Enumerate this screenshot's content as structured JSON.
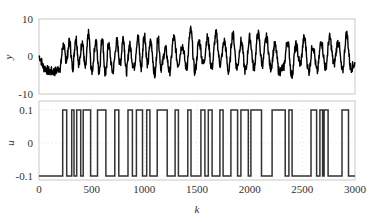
{
  "chart_data": [
    {
      "type": "line",
      "panel": "top",
      "title": "",
      "xlabel": "",
      "ylabel": "y",
      "xlim": [
        0,
        3000
      ],
      "ylim": [
        -10,
        10
      ],
      "yticks": [
        "10",
        "0",
        "-10"
      ],
      "grid": false,
      "series": [
        {
          "name": "y",
          "color": "#000000",
          "description": "noisy oscillating output response; ~-3 baseline for k<230, then oscillates roughly between -7 and 7",
          "x": [
            0,
            50,
            100,
            150,
            200,
            230,
            260,
            290,
            320,
            350,
            380,
            410,
            440,
            470,
            500,
            540,
            570,
            600,
            630,
            660,
            700,
            740,
            770,
            800,
            830,
            860,
            900,
            940,
            970,
            1000,
            1030,
            1060,
            1100,
            1130,
            1160,
            1200,
            1240,
            1280,
            1320,
            1360,
            1400,
            1440,
            1480,
            1520,
            1560,
            1600,
            1640,
            1680,
            1720,
            1760,
            1800,
            1840,
            1880,
            1920,
            1960,
            2000,
            2040,
            2080,
            2120,
            2160,
            2200,
            2240,
            2280,
            2320,
            2360,
            2400,
            2440,
            2480,
            2520,
            2560,
            2600,
            2640,
            2680,
            2720,
            2760,
            2800,
            2840,
            2880,
            2920,
            2960,
            3000
          ],
          "values": [
            0,
            -3,
            -4,
            -4,
            -3,
            3,
            -1,
            4,
            -3,
            5,
            -2,
            4,
            -3,
            6,
            -4,
            4,
            -4,
            5,
            -5,
            3,
            -4,
            4,
            -2,
            5,
            -4,
            3,
            -3,
            5,
            -3,
            6,
            -2,
            4,
            -5,
            5,
            -3,
            2,
            -4,
            5,
            -2,
            3,
            -3,
            7,
            -4,
            4,
            -2,
            5,
            -3,
            6,
            -2,
            4,
            -4,
            6,
            -3,
            4,
            -4,
            5,
            -3,
            6,
            -2,
            5,
            -3,
            3,
            -4,
            -3,
            4,
            -5,
            3,
            -2,
            5,
            -4,
            3,
            -4,
            4,
            -3,
            5,
            -2,
            4,
            -4,
            6,
            -3,
            -2
          ]
        }
      ]
    },
    {
      "type": "line",
      "panel": "bottom",
      "step": true,
      "title": "",
      "xlabel": "k",
      "ylabel": "u",
      "xlim": [
        0,
        3000
      ],
      "ylim": [
        -0.1,
        0.1
      ],
      "xticks": [
        "0",
        "500",
        "1000",
        "1500",
        "2000",
        "2500",
        "3000"
      ],
      "yticks": [
        "0.1",
        "0",
        "-0.1"
      ],
      "grid": true,
      "series": [
        {
          "name": "u",
          "color": "#333333",
          "description": "PRBS input switching between -0.1 and 0.1",
          "levels": [
            -0.1,
            0.1
          ],
          "initial": -0.1,
          "high_intervals": [
            [
              225,
              263
            ],
            [
              310,
              332
            ],
            [
              358,
              396
            ],
            [
              420,
              490
            ],
            [
              555,
              635
            ],
            [
              720,
              758
            ],
            [
              845,
              887
            ],
            [
              925,
              983
            ],
            [
              1022,
              1053
            ],
            [
              1122,
              1217
            ],
            [
              1292,
              1323
            ],
            [
              1413,
              1443
            ],
            [
              1537,
              1575
            ],
            [
              1607,
              1643
            ],
            [
              1717,
              1748
            ],
            [
              1822,
              1885
            ],
            [
              1917,
              1987
            ],
            [
              2012,
              2112
            ],
            [
              2213,
              2337
            ],
            [
              2372,
              2403
            ],
            [
              2582,
              2635
            ],
            [
              2667,
              2692
            ],
            [
              2707,
              2745
            ],
            [
              2877,
              2938
            ]
          ]
        }
      ]
    }
  ]
}
